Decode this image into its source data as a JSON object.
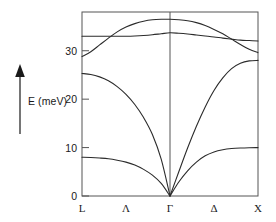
{
  "figure": {
    "type": "phonon-dispersion",
    "ylabel": "E (meV)",
    "arrow_icon": "up-arrow-icon"
  },
  "chart_data": {
    "type": "line",
    "title": "",
    "xlabel": "",
    "ylabel": "E (meV)",
    "ylim": [
      0,
      38
    ],
    "xlim": [
      0,
      2
    ],
    "grid": false,
    "legend": null,
    "yticks": [
      0,
      10,
      20,
      30
    ],
    "ytick_labels": [
      "0",
      "10",
      "20",
      "30"
    ],
    "xticks": [
      0,
      0.5,
      1,
      1.5,
      2
    ],
    "xtick_labels": [
      "L",
      "Λ",
      "Γ",
      "Δ",
      "X"
    ],
    "x_symmetry_points": [
      "L",
      "Γ",
      "X"
    ],
    "x_branch_labels": [
      "Λ",
      "Δ"
    ],
    "series": [
      {
        "name": "TA",
        "x": [
          0,
          0.1,
          0.2,
          0.3,
          0.4,
          0.5,
          0.6,
          0.7,
          0.8,
          0.9,
          1.0,
          1.1,
          1.2,
          1.3,
          1.4,
          1.5,
          1.6,
          1.7,
          1.8,
          1.9,
          2.0
        ],
        "values": [
          8.0,
          7.95,
          7.85,
          7.7,
          7.4,
          7.0,
          6.4,
          5.5,
          4.3,
          2.6,
          0.0,
          2.9,
          5.2,
          7.0,
          8.3,
          9.1,
          9.55,
          9.8,
          9.92,
          9.98,
          10.0
        ]
      },
      {
        "name": "LA",
        "x": [
          0,
          0.1,
          0.2,
          0.3,
          0.4,
          0.5,
          0.6,
          0.7,
          0.8,
          0.9,
          1.0,
          1.1,
          1.2,
          1.3,
          1.4,
          1.5,
          1.6,
          1.7,
          1.8,
          1.9,
          2.0
        ],
        "values": [
          25.3,
          25.1,
          24.6,
          23.8,
          22.6,
          21.0,
          18.9,
          16.2,
          12.7,
          7.6,
          0.0,
          5.0,
          9.9,
          14.4,
          18.4,
          21.8,
          24.4,
          26.3,
          27.4,
          27.9,
          28.0
        ]
      },
      {
        "name": "TO",
        "x": [
          0,
          0.1,
          0.2,
          0.3,
          0.4,
          0.5,
          0.6,
          0.7,
          0.8,
          0.9,
          1.0,
          1.1,
          1.2,
          1.3,
          1.4,
          1.5,
          1.6,
          1.7,
          1.8,
          1.9,
          2.0
        ],
        "values": [
          33.0,
          33.0,
          33.0,
          33.0,
          33.0,
          33.0,
          33.05,
          33.15,
          33.3,
          33.5,
          33.7,
          33.6,
          33.45,
          33.25,
          33.05,
          32.85,
          32.6,
          32.4,
          32.2,
          32.1,
          32.0
        ]
      },
      {
        "name": "LO",
        "x": [
          0,
          0.1,
          0.2,
          0.3,
          0.4,
          0.5,
          0.6,
          0.7,
          0.8,
          0.9,
          1.0,
          1.1,
          1.2,
          1.3,
          1.4,
          1.5,
          1.6,
          1.7,
          1.8,
          1.9,
          2.0
        ],
        "values": [
          28.8,
          29.8,
          31.2,
          32.6,
          33.9,
          34.9,
          35.6,
          36.1,
          36.4,
          36.5,
          36.5,
          36.4,
          36.2,
          35.8,
          35.2,
          34.4,
          33.5,
          32.4,
          31.3,
          30.3,
          29.6
        ]
      }
    ]
  },
  "colors": {
    "curve": "#2b2b2b",
    "frame": "#555555",
    "text": "#1a1a1a",
    "background": "#ffffff"
  }
}
